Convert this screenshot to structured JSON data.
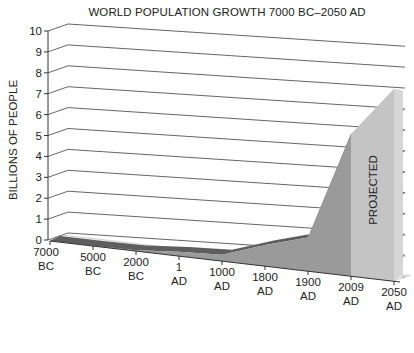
{
  "chart_data": {
    "type": "area",
    "title": "WORLD POPULATION GROWTH 7000 BC–2050 AD",
    "xlabel": "",
    "ylabel": "BILLIONS OF PEOPLE",
    "ylim": [
      0,
      10
    ],
    "yticks": [
      "0",
      "1",
      "2",
      "3",
      "4",
      "5",
      "6",
      "7",
      "8",
      "9",
      "10"
    ],
    "categories": [
      "7000 BC",
      "5000 BC",
      "2000 BC",
      "1 AD",
      "1000 AD",
      "1800 AD",
      "1900 AD",
      "2009 AD",
      "2050 AD"
    ],
    "category_lines": [
      [
        "7000",
        "BC"
      ],
      [
        "5000",
        "BC"
      ],
      [
        "2000",
        "BC"
      ],
      [
        "1",
        "AD"
      ],
      [
        "1000",
        "AD"
      ],
      [
        "1800",
        "AD"
      ],
      [
        "1900",
        "AD"
      ],
      [
        "2009",
        "AD"
      ],
      [
        "2050",
        "AD"
      ]
    ],
    "series": [
      {
        "name": "World population (billions)",
        "values": [
          0.01,
          0.01,
          0.03,
          0.2,
          0.3,
          1.0,
          1.6,
          6.8,
          9.2
        ]
      }
    ],
    "annotations": [
      {
        "text": "PROJECTED",
        "region": "2009 AD–2050 AD",
        "orientation": "vertical"
      }
    ],
    "grid": true,
    "style": "3d",
    "legend": "none"
  },
  "colors": {
    "front_face": "#9a9a9a",
    "top_edge": "#5e5e5e",
    "projected_face": "#c4c4c4",
    "projected_side": "#d6d6d6",
    "grid": "#555555",
    "axis": "#333333"
  }
}
